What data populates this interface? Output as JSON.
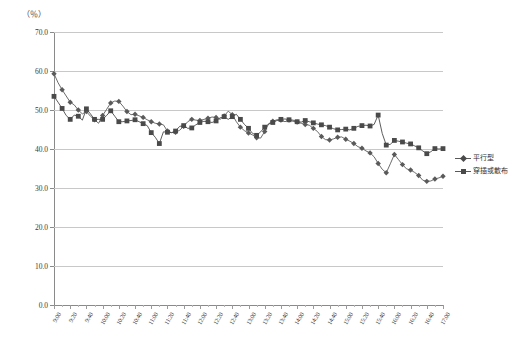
{
  "chart": {
    "unit_label": "（％）",
    "axis": {
      "y_ticks": [
        "0.0",
        "10.0",
        "20.0",
        "30.0",
        "40.0",
        "50.0",
        "60.0",
        "70.0"
      ],
      "x_ticks": [
        "9:00",
        "9:20",
        "9:40",
        "10:00",
        "10:20",
        "10:40",
        "11:00",
        "11:20",
        "11:40",
        "12:00",
        "12:20",
        "12:40",
        "13:00",
        "13:20",
        "13:40",
        "14:00",
        "14:20",
        "14:40",
        "15:00",
        "15:20",
        "15:40",
        "16:00",
        "16:20",
        "16:40",
        "17:00"
      ]
    },
    "legend": {
      "items": [
        {
          "label": "平行型",
          "marker": "diamond",
          "color": "#5a5a5a"
        },
        {
          "label": "穿插或散布",
          "marker": "square",
          "color": "#4a4a4a"
        }
      ]
    }
  },
  "chart_data": {
    "type": "line",
    "title": "",
    "xlabel": "",
    "ylabel": "（％）",
    "ylim": [
      0,
      70
    ],
    "ygrid": true,
    "legend_position": "right",
    "x": [
      "9:00",
      "9:05",
      "9:10",
      "9:15",
      "9:20",
      "9:25",
      "9:30",
      "9:35",
      "9:40",
      "9:45",
      "9:50",
      "9:55",
      "10:00",
      "10:05",
      "10:10",
      "10:15",
      "10:20",
      "10:25",
      "10:30",
      "10:35",
      "10:40",
      "10:45",
      "10:50",
      "10:55",
      "11:00",
      "11:05",
      "11:10",
      "11:15",
      "11:20",
      "11:25",
      "11:30",
      "11:35",
      "11:40",
      "11:45",
      "11:50",
      "11:55",
      "12:00",
      "12:05",
      "12:10",
      "12:15",
      "12:20",
      "12:25",
      "12:30",
      "12:35",
      "12:40",
      "12:45",
      "12:50",
      "12:55",
      "13:00",
      "13:05",
      "13:10",
      "13:15",
      "13:20",
      "13:25",
      "13:30",
      "13:35",
      "13:40",
      "13:45",
      "13:50",
      "13:55",
      "14:00",
      "14:05",
      "14:10",
      "14:15",
      "14:20",
      "14:25",
      "14:30",
      "14:35",
      "14:40",
      "14:45",
      "14:50",
      "14:55",
      "15:00",
      "15:05",
      "15:10",
      "15:15",
      "15:20",
      "15:25",
      "15:30",
      "15:35",
      "15:40",
      "15:45",
      "15:50",
      "15:55",
      "16:00",
      "16:05",
      "16:10",
      "16:15",
      "16:20",
      "16:25",
      "16:30",
      "16:35",
      "16:40",
      "16:45",
      "16:50",
      "16:55",
      "17:00"
    ],
    "series": [
      {
        "name": "平行型",
        "marker": "diamond",
        "color": "#5a5a5a",
        "values": [
          59.3,
          57.0,
          55.2,
          53.6,
          52.0,
          51.3,
          50.0,
          49.0,
          49.6,
          48.4,
          47.5,
          46.6,
          48.6,
          50.2,
          51.8,
          52.3,
          52.2,
          51.0,
          49.6,
          48.8,
          48.9,
          48.5,
          48.1,
          47.5,
          47.0,
          46.6,
          46.4,
          46.2,
          44.6,
          44.2,
          44.3,
          44.8,
          45.8,
          47.0,
          47.6,
          47.4,
          47.3,
          47.6,
          47.9,
          48.2,
          48.1,
          47.6,
          48.5,
          49.7,
          48.8,
          47.0,
          45.6,
          44.7,
          44.1,
          43.6,
          42.9,
          42.8,
          44.5,
          46.5,
          47.1,
          47.5,
          47.4,
          47.0,
          47.4,
          47.1,
          46.9,
          46.6,
          46.3,
          46.1,
          45.3,
          44.5,
          43.2,
          42.4,
          42.3,
          42.6,
          43.0,
          43.1,
          42.5,
          42.0,
          41.4,
          40.6,
          40.2,
          39.5,
          39.0,
          38.0,
          36.3,
          34.8,
          33.9,
          36.2,
          38.6,
          37.3,
          36.0,
          34.9,
          34.6,
          34.0,
          33.2,
          32.0,
          31.7,
          31.8,
          32.3,
          32.6,
          33.0
        ]
      },
      {
        "name": "穿插或散布",
        "marker": "square",
        "color": "#4a4a4a",
        "values": [
          53.5,
          52.0,
          50.4,
          48.6,
          47.6,
          48.7,
          48.4,
          47.4,
          50.3,
          49.0,
          47.6,
          47.6,
          47.6,
          48.6,
          49.8,
          48.4,
          47.0,
          47.0,
          47.2,
          47.3,
          47.5,
          47.0,
          46.5,
          46.0,
          44.2,
          43.0,
          41.4,
          44.4,
          44.3,
          44.2,
          44.6,
          45.8,
          46.0,
          45.3,
          45.4,
          46.2,
          46.8,
          47.1,
          47.0,
          46.8,
          47.2,
          48.0,
          48.3,
          47.6,
          48.3,
          48.9,
          47.6,
          46.3,
          45.3,
          44.0,
          43.5,
          44.4,
          45.6,
          46.4,
          46.8,
          47.3,
          47.6,
          47.7,
          47.5,
          47.4,
          47.0,
          46.9,
          47.3,
          47.0,
          46.7,
          46.4,
          46.2,
          46.0,
          45.6,
          45.2,
          44.9,
          45.0,
          45.1,
          44.9,
          45.3,
          45.8,
          46.0,
          46.1,
          45.9,
          46.3,
          48.7,
          44.0,
          41.0,
          41.2,
          42.2,
          42.0,
          41.8,
          41.5,
          41.3,
          40.8,
          40.3,
          39.5,
          38.8,
          39.3,
          40.1,
          40.0,
          40.1
        ]
      }
    ]
  }
}
